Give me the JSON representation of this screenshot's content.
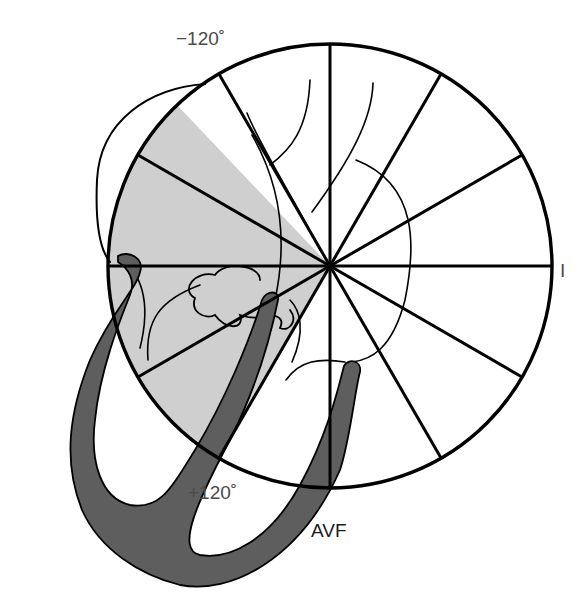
{
  "figure": {
    "type": "hexaxial-reference-diagram",
    "labels": {
      "top_left": "−120˚",
      "right": "I",
      "bottom_left": "+120˚",
      "bottom": "AVF"
    },
    "circle": {
      "cx": 330,
      "cy": 266,
      "r": 222
    },
    "spoke_angles_deg": [
      0,
      30,
      60,
      90,
      120,
      150,
      180,
      -150,
      -120,
      -90,
      -60,
      -30
    ],
    "shaded_sector": {
      "from_deg": -133.5,
      "to_deg": 120,
      "color": "#cfcfcf"
    },
    "colors": {
      "line": "#000000",
      "sector_fill": "#cfcfcf",
      "myocardium_fill": "#5e5e5e",
      "label_gray": "#4a4a4a",
      "background": "#ffffff"
    }
  }
}
